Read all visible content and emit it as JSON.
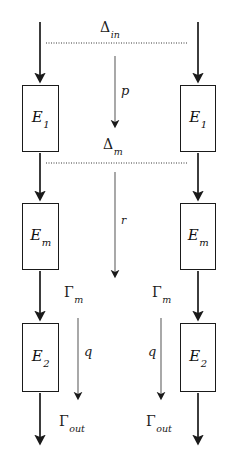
{
  "diagram": {
    "type": "flow-diagram",
    "background_color": "#ffffff",
    "line_color": "#1a1a1a",
    "boxes": [
      {
        "id": "left-e1",
        "label_main": "E",
        "label_sub": "1",
        "x": 22,
        "y": 85,
        "w": 37,
        "h": 67
      },
      {
        "id": "right-e1",
        "label_main": "E",
        "label_sub": "1",
        "x": 180,
        "y": 85,
        "w": 36,
        "h": 67
      },
      {
        "id": "left-em",
        "label_main": "E",
        "label_sub": "m",
        "x": 22,
        "y": 203,
        "w": 37,
        "h": 67
      },
      {
        "id": "right-em",
        "label_main": "E",
        "label_sub": "m",
        "x": 180,
        "y": 203,
        "w": 36,
        "h": 67
      },
      {
        "id": "left-e2",
        "label_main": "E",
        "label_sub": "2",
        "x": 22,
        "y": 323,
        "w": 37,
        "h": 69
      },
      {
        "id": "right-e2",
        "label_main": "E",
        "label_sub": "2",
        "x": 180,
        "y": 323,
        "w": 36,
        "h": 69
      }
    ],
    "interface_lines": [
      {
        "id": "delta-in-line",
        "label_main": "Δ",
        "label_sub": "in",
        "y": 43,
        "x1": 46,
        "x2": 188
      },
      {
        "id": "delta-m-line",
        "label_main": "Δ",
        "label_sub": "m",
        "y": 163,
        "x1": 46,
        "x2": 188
      }
    ],
    "flow_labels": [
      {
        "id": "label-p",
        "text": "p"
      },
      {
        "id": "label-r",
        "text": "r"
      },
      {
        "id": "label-q-left",
        "text": "q"
      },
      {
        "id": "label-q-right",
        "text": "q"
      }
    ],
    "gamma_labels": [
      {
        "id": "gamma-m-left",
        "label_main": "Γ",
        "label_sub": "m"
      },
      {
        "id": "gamma-m-right",
        "label_main": "Γ",
        "label_sub": "m"
      },
      {
        "id": "gamma-out-left",
        "label_main": "Γ",
        "label_sub": "out"
      },
      {
        "id": "gamma-out-right",
        "label_main": "Γ",
        "label_sub": "out"
      }
    ]
  }
}
